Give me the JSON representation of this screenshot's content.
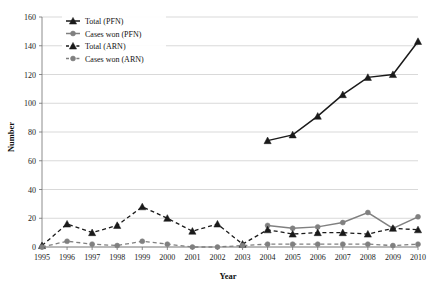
{
  "chart_data": {
    "type": "line",
    "title": "",
    "xlabel": "Year",
    "ylabel": "Number",
    "x": [
      1995,
      1996,
      1997,
      1998,
      1999,
      2000,
      2001,
      2002,
      2003,
      2004,
      2005,
      2006,
      2007,
      2008,
      2009,
      2010
    ],
    "xlim": [
      1995,
      2010
    ],
    "ylim": [
      0,
      160
    ],
    "yticks": [
      0,
      20,
      40,
      60,
      80,
      100,
      120,
      140,
      160
    ],
    "xticks": [
      "1995",
      "1996",
      "1997",
      "1998",
      "1999",
      "2000",
      "2001",
      "2002",
      "2003",
      "2004",
      "2005",
      "2006",
      "2007",
      "2008",
      "2009",
      "2010"
    ],
    "grid": true,
    "legend_position": "top-left",
    "series": [
      {
        "name": "Total (PFN)",
        "marker": "triangle",
        "linestyle": "solid",
        "color": "#1a1a1a",
        "x": [
          2004,
          2005,
          2006,
          2007,
          2008,
          2009,
          2010
        ],
        "values": [
          74,
          78,
          91,
          106,
          118,
          120,
          143
        ]
      },
      {
        "name": "Cases won (PFN)",
        "marker": "circle",
        "linestyle": "solid",
        "color": "#808080",
        "x": [
          2004,
          2005,
          2006,
          2007,
          2008,
          2009,
          2010
        ],
        "values": [
          15,
          13,
          14,
          17,
          24,
          13,
          21
        ]
      },
      {
        "name": "Total (ARN)",
        "marker": "triangle",
        "linestyle": "dashed",
        "color": "#1a1a1a",
        "x": [
          1995,
          1996,
          1997,
          1998,
          1999,
          2000,
          2001,
          2002,
          2003,
          2004,
          2005,
          2006,
          2007,
          2008,
          2009,
          2010
        ],
        "values": [
          1,
          16,
          10,
          15,
          28,
          20,
          11,
          16,
          2,
          12,
          9,
          10,
          10,
          9,
          13,
          12
        ]
      },
      {
        "name": "Cases won (ARN)",
        "marker": "circle",
        "linestyle": "dashed",
        "color": "#808080",
        "x": [
          1995,
          1996,
          1997,
          1998,
          1999,
          2000,
          2001,
          2002,
          2003,
          2004,
          2005,
          2006,
          2007,
          2008,
          2009,
          2010
        ],
        "values": [
          0,
          4,
          2,
          1,
          4,
          2,
          0,
          0,
          1,
          2,
          2,
          2,
          2,
          2,
          1,
          2
        ]
      }
    ]
  },
  "axes": {
    "ylabel": "Number",
    "xlabel": "Year"
  },
  "legend": {
    "items": [
      {
        "label": "Total (PFN)"
      },
      {
        "label": "Cases won (PFN)"
      },
      {
        "label": "Total (ARN)"
      },
      {
        "label": "Cases won (ARN)"
      }
    ]
  }
}
